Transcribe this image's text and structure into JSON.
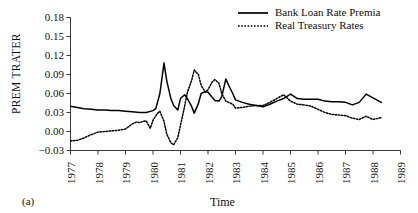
{
  "panel": {
    "label": "(a)"
  },
  "legend": {
    "position": "top-right",
    "items": [
      {
        "label": "Bank Loan Rate Premia",
        "style": "solid",
        "color": "#000000"
      },
      {
        "label": "Real Treasury Rates",
        "style": "dotted",
        "color": "#000000"
      }
    ]
  },
  "chart_data": {
    "type": "line",
    "title": "",
    "subtitle": "",
    "xlabel": "Time",
    "ylabel": "PREM TRATER",
    "xlim": [
      1977,
      1989
    ],
    "ylim": [
      -0.03,
      0.18
    ],
    "yticks": [
      -0.03,
      0.0,
      0.03,
      0.06,
      0.09,
      0.12,
      0.15,
      0.18
    ],
    "ytick_labels": [
      "−0.03",
      "0.00",
      "0.03",
      "0.06",
      "0.09",
      "0.12",
      "0.15",
      "0.18"
    ],
    "xticks": [
      1977,
      1978,
      1979,
      1980,
      1981,
      1982,
      1983,
      1984,
      1985,
      1986,
      1987,
      1988,
      1989
    ],
    "xtick_labels": [
      "1977",
      "1978",
      "1979",
      "1980",
      "1981",
      "1982",
      "1983",
      "1984",
      "1985",
      "1986",
      "1987",
      "1988",
      "1989"
    ],
    "grid": false,
    "legend_position": "top-right",
    "series": [
      {
        "name": "Bank Loan Rate Premia",
        "style": "solid",
        "color": "#000000",
        "x": [
          1977.0,
          1977.25,
          1977.5,
          1977.75,
          1978.0,
          1978.25,
          1978.5,
          1978.75,
          1979.0,
          1979.25,
          1979.5,
          1979.75,
          1980.0,
          1980.1,
          1980.25,
          1980.4,
          1980.5,
          1980.65,
          1980.75,
          1980.9,
          1981.0,
          1981.15,
          1981.25,
          1981.4,
          1981.5,
          1981.65,
          1981.75,
          1981.9,
          1982.0,
          1982.15,
          1982.25,
          1982.4,
          1982.5,
          1982.65,
          1982.75,
          1982.9,
          1983.0,
          1983.25,
          1983.5,
          1983.75,
          1984.0,
          1984.25,
          1984.5,
          1984.75,
          1985.0,
          1985.25,
          1985.5,
          1985.75,
          1986.0,
          1986.25,
          1986.5,
          1986.75,
          1987.0,
          1987.25,
          1987.5,
          1987.75,
          1988.0,
          1988.3
        ],
        "y": [
          0.04,
          0.038,
          0.036,
          0.035,
          0.034,
          0.034,
          0.033,
          0.033,
          0.032,
          0.031,
          0.03,
          0.03,
          0.033,
          0.036,
          0.06,
          0.108,
          0.08,
          0.052,
          0.041,
          0.034,
          0.052,
          0.058,
          0.052,
          0.04,
          0.029,
          0.044,
          0.06,
          0.063,
          0.062,
          0.054,
          0.049,
          0.048,
          0.055,
          0.083,
          0.073,
          0.06,
          0.05,
          0.046,
          0.043,
          0.041,
          0.039,
          0.043,
          0.048,
          0.052,
          0.059,
          0.052,
          0.051,
          0.051,
          0.051,
          0.048,
          0.047,
          0.047,
          0.046,
          0.042,
          0.046,
          0.059,
          0.053,
          0.046
        ]
      },
      {
        "name": "Real Treasury Rates",
        "style": "dotted",
        "color": "#000000",
        "x": [
          1977.0,
          1977.25,
          1977.5,
          1977.75,
          1978.0,
          1978.25,
          1978.5,
          1978.75,
          1979.0,
          1979.25,
          1979.4,
          1979.5,
          1979.65,
          1979.75,
          1979.9,
          1980.0,
          1980.15,
          1980.25,
          1980.4,
          1980.5,
          1980.65,
          1980.75,
          1980.9,
          1981.0,
          1981.15,
          1981.25,
          1981.4,
          1981.5,
          1981.65,
          1981.75,
          1981.9,
          1982.0,
          1982.15,
          1982.25,
          1982.4,
          1982.5,
          1982.65,
          1982.75,
          1982.9,
          1983.0,
          1983.25,
          1983.5,
          1983.75,
          1984.0,
          1984.25,
          1984.5,
          1984.75,
          1985.0,
          1985.25,
          1985.5,
          1985.75,
          1986.0,
          1986.25,
          1986.5,
          1986.75,
          1987.0,
          1987.25,
          1987.5,
          1987.75,
          1988.0,
          1988.3
        ],
        "y": [
          -0.015,
          -0.014,
          -0.01,
          -0.005,
          -0.001,
          0.0,
          0.001,
          0.002,
          0.004,
          0.012,
          0.015,
          0.014,
          0.016,
          0.017,
          0.005,
          0.018,
          0.028,
          0.032,
          0.016,
          -0.004,
          -0.018,
          -0.021,
          -0.01,
          0.01,
          0.04,
          0.062,
          0.08,
          0.097,
          0.09,
          0.073,
          0.062,
          0.066,
          0.078,
          0.082,
          0.076,
          0.06,
          0.048,
          0.046,
          0.043,
          0.037,
          0.038,
          0.04,
          0.041,
          0.041,
          0.046,
          0.052,
          0.058,
          0.048,
          0.043,
          0.042,
          0.04,
          0.035,
          0.03,
          0.027,
          0.026,
          0.025,
          0.021,
          0.019,
          0.024,
          0.019,
          0.022
        ]
      }
    ]
  }
}
